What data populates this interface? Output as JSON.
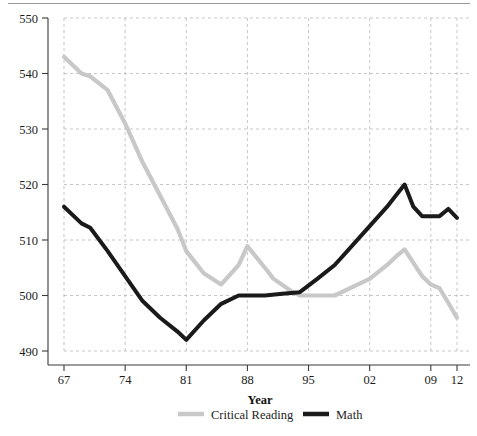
{
  "chart_data": {
    "type": "line",
    "title": "",
    "xlabel": "Year",
    "ylabel": "",
    "xlim": [
      67,
      112
    ],
    "ylim": [
      490,
      550
    ],
    "grid": true,
    "legend_position": "bottom",
    "y_ticks": [
      550,
      540,
      530,
      520,
      510,
      500,
      490
    ],
    "y_tick_labels": [
      "550",
      "540",
      "530",
      "520",
      "510",
      "500",
      "490"
    ],
    "x_ticks": [
      67,
      74,
      81,
      88,
      95,
      102,
      109,
      112
    ],
    "x_tick_labels": [
      "67",
      "74",
      "81",
      "88",
      "95",
      "02",
      "09",
      "12"
    ],
    "series": [
      {
        "name": "Critical Reading",
        "color": "#c8c8c8",
        "x": [
          67,
          69,
          70,
          72,
          74,
          76,
          78,
          80,
          81,
          83,
          85,
          87,
          88,
          90,
          91,
          93,
          94,
          96,
          98,
          100,
          102,
          104,
          105,
          106,
          108,
          109,
          110,
          111,
          112
        ],
        "values": [
          543,
          540,
          539.5,
          537,
          531,
          524,
          518,
          512,
          508,
          504,
          502,
          505.5,
          508.9,
          505,
          503,
          500.8,
          500,
          500,
          500,
          501.5,
          503,
          505.5,
          507,
          508.3,
          503.5,
          502,
          501.3,
          498.7,
          496
        ]
      },
      {
        "name": "Math",
        "color": "#1a1a1a",
        "x": [
          67,
          69,
          70,
          72,
          74,
          76,
          78,
          80,
          81,
          83,
          85,
          87,
          88,
          90,
          92,
          94,
          96,
          98,
          100,
          102,
          104,
          105,
          106,
          107,
          108,
          109,
          110,
          111,
          112
        ],
        "values": [
          516,
          513,
          512.2,
          508,
          503.5,
          499,
          496,
          493.5,
          492,
          495.5,
          498.5,
          500,
          500,
          500,
          500.3,
          500.6,
          503,
          505.5,
          509,
          512.5,
          516,
          518,
          520,
          516,
          514.3,
          514.3,
          514.3,
          515.6,
          514
        ]
      }
    ]
  },
  "axis": {
    "x_title": "Year"
  },
  "legend": {
    "entries": [
      {
        "label": "Critical Reading",
        "color": "#c8c8c8"
      },
      {
        "label": "Math",
        "color": "#1a1a1a"
      }
    ]
  }
}
